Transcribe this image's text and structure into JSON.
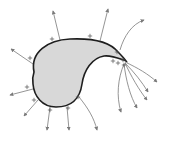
{
  "diagram": {
    "title": "",
    "colors": {
      "conductor_fill": "#d8d8d8",
      "conductor_outline": "#1e1e1e",
      "field_lines": "#7a7a7a",
      "charges": "#555555"
    },
    "charge_symbol": "+",
    "conductor": {
      "shape": "teardrop",
      "path": "M34,72 C30,52 48,40 70,39 C92,38 110,42 118,52 C122,56 124,58 126,61 C120,59 112,55 104,56 C92,58 84,70 82,84 C80,98 72,107 56,107 C42,107 34,96 33,84 C32,78 33,75 34,72 Z"
    },
    "field_lines": [
      {
        "d": "M60,40 L53,11"
      },
      {
        "d": "M100,41 L108,9"
      },
      {
        "d": "M33,64 L11,49"
      },
      {
        "d": "M33,89 L10,95"
      },
      {
        "d": "M38,100 L24,116"
      },
      {
        "d": "M50,107 L47,130"
      },
      {
        "d": "M67,107 L69,130"
      },
      {
        "d": "M79,97 C88,108 94,118 97,130"
      },
      {
        "d": "M120,50 C124,36 132,24 144,20"
      },
      {
        "d": "M125,62 C138,68 148,74 157,82"
      },
      {
        "d": "M125,63 C134,72 142,82 148,92"
      },
      {
        "d": "M125,63 C131,76 139,90 147,100"
      },
      {
        "d": "M124,64 C126,80 130,96 137,108"
      },
      {
        "d": "M124,64 C118,78 116,96 121,112"
      }
    ],
    "charges": [
      {
        "x": 52,
        "y": 39
      },
      {
        "x": 90,
        "y": 36
      },
      {
        "x": 30,
        "y": 58
      },
      {
        "x": 27,
        "y": 87
      },
      {
        "x": 34,
        "y": 100
      },
      {
        "x": 50,
        "y": 110
      },
      {
        "x": 68,
        "y": 108
      },
      {
        "x": 78,
        "y": 97
      },
      {
        "x": 117,
        "y": 52
      },
      {
        "x": 113,
        "y": 61
      },
      {
        "x": 118,
        "y": 63
      },
      {
        "x": 123,
        "y": 60
      },
      {
        "x": 124,
        "y": 65
      }
    ]
  }
}
